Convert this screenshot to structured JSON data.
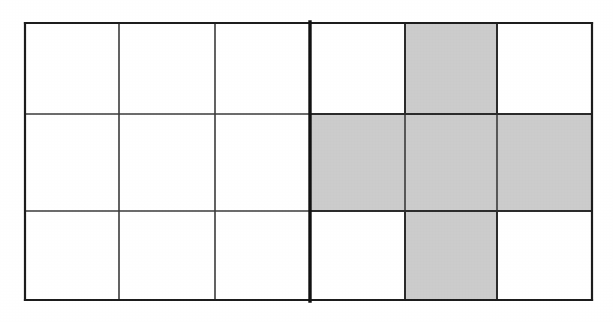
{
  "figure": {
    "type": "grid-diagram",
    "columns": 6,
    "rows": 3,
    "background_color": "#ffffff",
    "shade_color": "#cbcbcb",
    "line_color": "#3a3a3a",
    "outer_border_color": "#1c1c1c",
    "divider_color": "#111111",
    "geometry": {
      "x_lines": [
        25,
        119,
        215,
        310,
        405,
        497,
        592
      ],
      "y_lines": [
        23,
        114,
        211,
        300
      ]
    },
    "divider": {
      "name": "vertical-divider",
      "x": 310,
      "description": "Thick vertical line splitting the grid into a 3-column left half and a 3-column right half"
    },
    "cells": [
      {
        "row": 0,
        "col": 0,
        "shaded": false
      },
      {
        "row": 0,
        "col": 1,
        "shaded": false
      },
      {
        "row": 0,
        "col": 2,
        "shaded": false
      },
      {
        "row": 0,
        "col": 3,
        "shaded": false
      },
      {
        "row": 0,
        "col": 4,
        "shaded": true
      },
      {
        "row": 0,
        "col": 5,
        "shaded": false
      },
      {
        "row": 1,
        "col": 0,
        "shaded": false
      },
      {
        "row": 1,
        "col": 1,
        "shaded": false
      },
      {
        "row": 1,
        "col": 2,
        "shaded": false
      },
      {
        "row": 1,
        "col": 3,
        "shaded": true
      },
      {
        "row": 1,
        "col": 4,
        "shaded": true
      },
      {
        "row": 1,
        "col": 5,
        "shaded": true
      },
      {
        "row": 2,
        "col": 0,
        "shaded": false
      },
      {
        "row": 2,
        "col": 1,
        "shaded": false
      },
      {
        "row": 2,
        "col": 2,
        "shaded": false
      },
      {
        "row": 2,
        "col": 3,
        "shaded": false
      },
      {
        "row": 2,
        "col": 4,
        "shaded": true
      },
      {
        "row": 2,
        "col": 5,
        "shaded": false
      }
    ],
    "shaded_count": 5,
    "empty_count": 13,
    "shape_name": "plus-cross"
  }
}
